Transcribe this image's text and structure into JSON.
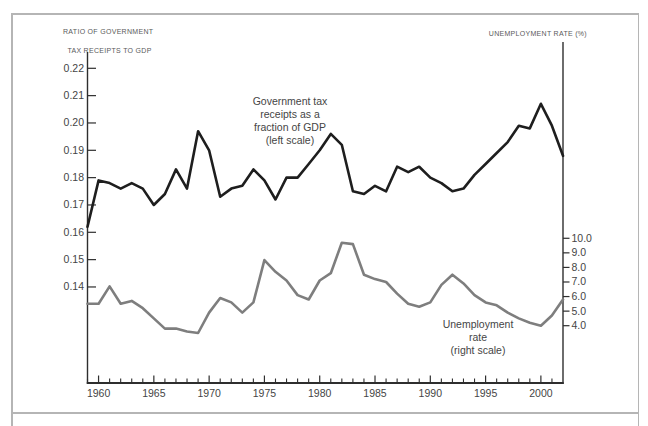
{
  "figure": {
    "border_color": "#b5b5b5"
  },
  "chart_data": {
    "type": "line",
    "x_years": [
      1959,
      1960,
      1961,
      1962,
      1963,
      1964,
      1965,
      1966,
      1967,
      1968,
      1969,
      1970,
      1971,
      1972,
      1973,
      1974,
      1975,
      1976,
      1977,
      1978,
      1979,
      1980,
      1981,
      1982,
      1983,
      1984,
      1985,
      1986,
      1987,
      1988,
      1989,
      1990,
      1991,
      1992,
      1993,
      1994,
      1995,
      1996,
      1997,
      1998,
      1999,
      2000,
      2001,
      2002
    ],
    "series": [
      {
        "name": "Government tax receipts as a fraction of GDP",
        "axis": "left",
        "color": "#1e1e1e",
        "values": [
          0.162,
          0.179,
          0.178,
          0.176,
          0.178,
          0.176,
          0.17,
          0.174,
          0.183,
          0.176,
          0.197,
          0.19,
          0.173,
          0.176,
          0.177,
          0.183,
          0.179,
          0.172,
          0.18,
          0.18,
          0.185,
          0.19,
          0.196,
          0.192,
          0.175,
          0.174,
          0.177,
          0.175,
          0.184,
          0.182,
          0.184,
          0.18,
          0.178,
          0.175,
          0.176,
          0.181,
          0.185,
          0.189,
          0.193,
          0.199,
          0.198,
          0.207,
          0.199,
          0.188
        ]
      },
      {
        "name": "Unemployment rate",
        "axis": "right",
        "color": "#7e7e7e",
        "values": [
          5.5,
          5.5,
          6.7,
          5.5,
          5.7,
          5.2,
          4.5,
          3.8,
          3.8,
          3.6,
          3.5,
          4.9,
          5.9,
          5.6,
          4.9,
          5.6,
          8.5,
          7.7,
          7.1,
          6.1,
          5.8,
          7.1,
          7.6,
          9.7,
          9.6,
          7.5,
          7.2,
          7.0,
          6.2,
          5.5,
          5.3,
          5.6,
          6.8,
          7.5,
          6.9,
          6.1,
          5.6,
          5.4,
          4.9,
          4.5,
          4.2,
          4.0,
          4.7,
          5.8
        ]
      }
    ],
    "left_axis": {
      "title_line1": "RATIO OF GOVERNMENT",
      "title_line2": "TAX RECEIPTS TO GDP",
      "tick_labels": [
        "0.22",
        "0.21",
        "0.20",
        "0.19",
        "0.18",
        "0.17",
        "0.16",
        "0.15",
        "0.14"
      ]
    },
    "right_axis": {
      "title": "UNEMPLOYMENT RATE (%)",
      "tick_labels": [
        "10.0",
        "9.0",
        "8.0",
        "7.0",
        "6.0",
        "5.0",
        "4.0"
      ]
    },
    "x_axis": {
      "major_tick_labels": [
        "1960",
        "1965",
        "1970",
        "1975",
        "1980",
        "1985",
        "1990",
        "1995",
        "2000"
      ]
    },
    "annotations": {
      "gov_lines": [
        "Government tax",
        "receipts as a",
        "fraction of GDP",
        "(left scale)"
      ],
      "unemp_lines": [
        "Unemployment",
        "rate",
        "(right scale)"
      ]
    }
  }
}
